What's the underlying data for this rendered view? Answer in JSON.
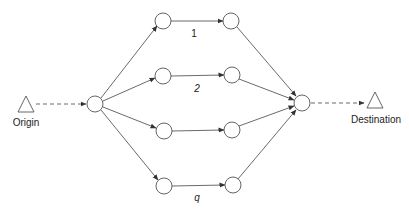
{
  "diagram": {
    "type": "parallel-path network",
    "origin": {
      "label": "Origin"
    },
    "destination": {
      "label": "Destination"
    },
    "paths": [
      {
        "label": "1"
      },
      {
        "label": "2"
      },
      {
        "label": ""
      },
      {
        "label": "q"
      }
    ],
    "colors": {
      "stroke": "#444444",
      "node_fill": "#ffffff",
      "text": "#222222"
    }
  }
}
